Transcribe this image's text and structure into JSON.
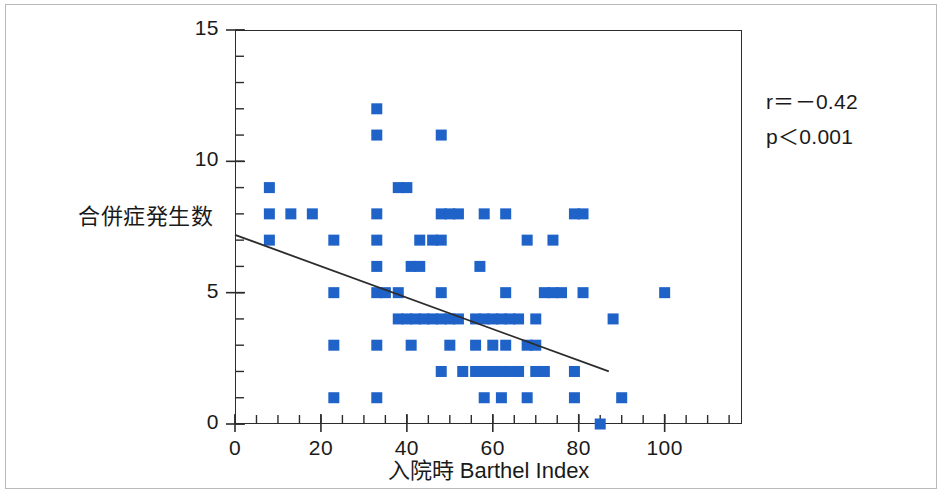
{
  "chart_data": {
    "type": "scatter",
    "title": "",
    "xlabel": "入院時 Barthel Index",
    "ylabel": "合併症発生数",
    "xlim": [
      0,
      118
    ],
    "ylim": [
      0,
      15
    ],
    "xticks": [
      0,
      20,
      40,
      60,
      80,
      100
    ],
    "yticks": [
      0,
      5,
      10,
      15
    ],
    "x_minor_tick_step": 5,
    "y_minor_tick_step": 1,
    "grid": false,
    "legend": null,
    "marker_color": "#1f62c8",
    "marker_shape": "square",
    "axis_color": "#2c2c2c",
    "annotations": [
      {
        "name": "correlation",
        "text": "r＝－0.42"
      },
      {
        "name": "p-value",
        "text": "p＜0.001"
      }
    ],
    "trendline": {
      "type": "linear-regression",
      "x_start": 0,
      "y_start": 7.2,
      "x_end": 87,
      "y_end": 2.0,
      "color": "#2c2c2c"
    },
    "points": [
      [
        8,
        8
      ],
      [
        13,
        8
      ],
      [
        18,
        8
      ],
      [
        8,
        9
      ],
      [
        8,
        7
      ],
      [
        23,
        7
      ],
      [
        33,
        8
      ],
      [
        38,
        9
      ],
      [
        40,
        9
      ],
      [
        48,
        8
      ],
      [
        50,
        8
      ],
      [
        52,
        8
      ],
      [
        33,
        12
      ],
      [
        33,
        11
      ],
      [
        48,
        11
      ],
      [
        58,
        8
      ],
      [
        63,
        8
      ],
      [
        79,
        8
      ],
      [
        81,
        8
      ],
      [
        23,
        5
      ],
      [
        33,
        5
      ],
      [
        35,
        5
      ],
      [
        38,
        5
      ],
      [
        48,
        5
      ],
      [
        63,
        5
      ],
      [
        72,
        5
      ],
      [
        74,
        5
      ],
      [
        76,
        5
      ],
      [
        81,
        5
      ],
      [
        100,
        5
      ],
      [
        33,
        6
      ],
      [
        41,
        6
      ],
      [
        43,
        6
      ],
      [
        57,
        6
      ],
      [
        33,
        7
      ],
      [
        43,
        7
      ],
      [
        46,
        7
      ],
      [
        48,
        7
      ],
      [
        68,
        7
      ],
      [
        74,
        7
      ],
      [
        38,
        4
      ],
      [
        40,
        4
      ],
      [
        42,
        4
      ],
      [
        44,
        4
      ],
      [
        46,
        4
      ],
      [
        48,
        4
      ],
      [
        50,
        4
      ],
      [
        52,
        4
      ],
      [
        56,
        4
      ],
      [
        58,
        4
      ],
      [
        60,
        4
      ],
      [
        62,
        4
      ],
      [
        64,
        4
      ],
      [
        66,
        4
      ],
      [
        70,
        4
      ],
      [
        88,
        4
      ],
      [
        23,
        3
      ],
      [
        33,
        3
      ],
      [
        41,
        3
      ],
      [
        50,
        3
      ],
      [
        56,
        3
      ],
      [
        60,
        3
      ],
      [
        63,
        3
      ],
      [
        68,
        3
      ],
      [
        70,
        3
      ],
      [
        48,
        2
      ],
      [
        53,
        2
      ],
      [
        56,
        2
      ],
      [
        58,
        2
      ],
      [
        60,
        2
      ],
      [
        62,
        2
      ],
      [
        64,
        2
      ],
      [
        66,
        2
      ],
      [
        70,
        2
      ],
      [
        72,
        2
      ],
      [
        79,
        2
      ],
      [
        23,
        1
      ],
      [
        33,
        1
      ],
      [
        58,
        1
      ],
      [
        62,
        1
      ],
      [
        68,
        1
      ],
      [
        79,
        1
      ],
      [
        90,
        1
      ],
      [
        85,
        0
      ]
    ]
  }
}
